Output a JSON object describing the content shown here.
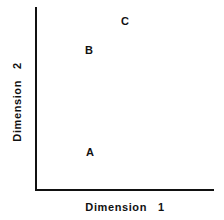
{
  "figure": {
    "x_axis_title": "Dimension   1",
    "y_axis_title": "Dimension   2",
    "points": [
      {
        "label": "A",
        "x": 90,
        "y": 152
      },
      {
        "label": "B",
        "x": 89,
        "y": 50
      },
      {
        "label": "C",
        "x": 125,
        "y": 21
      }
    ]
  },
  "chart_data": {
    "type": "scatter",
    "title": "",
    "xlabel": "Dimension 1",
    "ylabel": "Dimension 2",
    "grid": false,
    "ticks": false,
    "points": [
      {
        "label": "A",
        "x": 0.3,
        "y": 0.21
      },
      {
        "label": "B",
        "x": 0.3,
        "y": 0.77
      },
      {
        "label": "C",
        "x": 0.5,
        "y": 0.93
      }
    ],
    "xlim": [
      0,
      1
    ],
    "ylim": [
      0,
      1
    ]
  }
}
